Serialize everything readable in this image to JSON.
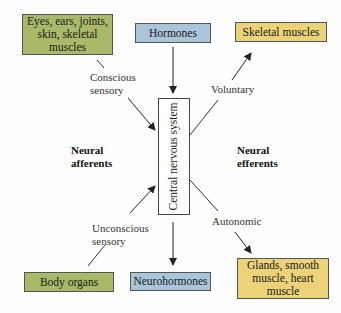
{
  "diagram": {
    "center": {
      "label": "Central nervous system"
    },
    "inputs": {
      "top_left": {
        "label": "Eyes, ears, joints, skin, skeletal muscles",
        "color": "#a9b96a"
      },
      "top_center": {
        "label": "Hormones",
        "color": "#a9c5d9"
      },
      "bottom_left": {
        "label": "Body organs",
        "color": "#a9b96a"
      }
    },
    "outputs": {
      "top_right": {
        "label": "Skeletal muscles",
        "color": "#ecd37a"
      },
      "bottom_center": {
        "label": "Neurohormones",
        "color": "#a9c5d9"
      },
      "bottom_right": {
        "label": "Glands, smooth muscle, heart muscle",
        "color": "#ecd37a"
      }
    },
    "edge_labels": {
      "conscious": "Conscious sensory",
      "unconscious": "Unconscious sensory",
      "voluntary": "Voluntary",
      "autonomic": "Autonomic"
    },
    "region_labels": {
      "afferents": "Neural afferents",
      "efferents": "Neural efferents"
    }
  }
}
